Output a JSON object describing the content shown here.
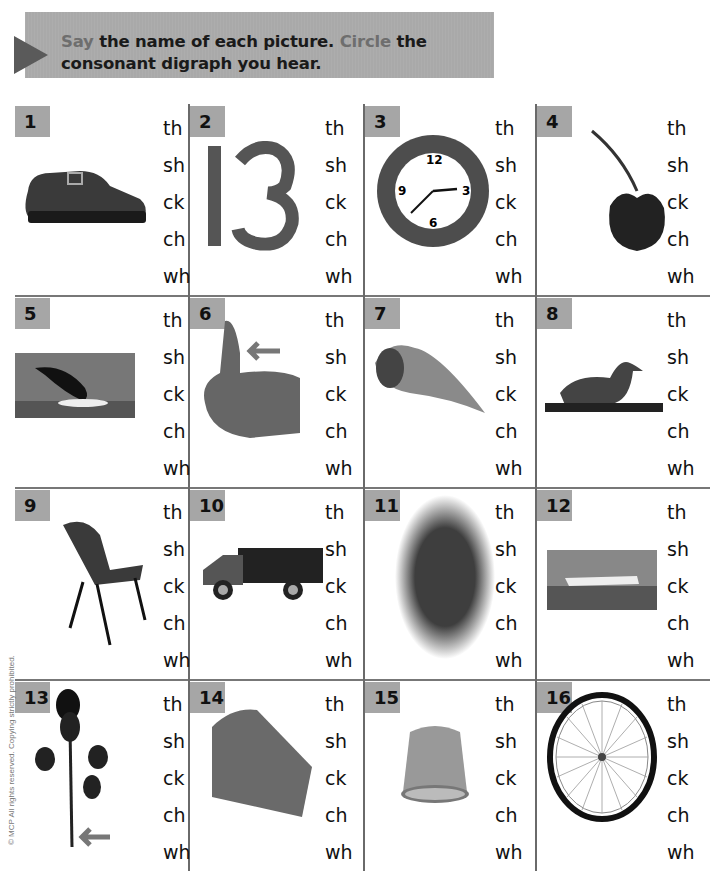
{
  "instruction": {
    "word_say": "Say",
    "part1": " the name of each picture. ",
    "word_circle": "Circle",
    "part2": " the consonant digraph you hear."
  },
  "choices": [
    "th",
    "sh",
    "ck",
    "ch",
    "wh"
  ],
  "items": [
    {
      "number": "1",
      "picture": "shoe-icon"
    },
    {
      "number": "2",
      "picture": "thirteen-icon"
    },
    {
      "number": "3",
      "picture": "clock-icon"
    },
    {
      "number": "4",
      "picture": "cherry-icon"
    },
    {
      "number": "5",
      "picture": "whale-icon"
    },
    {
      "number": "6",
      "picture": "thumb-icon"
    },
    {
      "number": "7",
      "picture": "shell-icon"
    },
    {
      "number": "8",
      "picture": "duck-icon"
    },
    {
      "number": "9",
      "picture": "chair-icon"
    },
    {
      "number": "10",
      "picture": "truck-icon"
    },
    {
      "number": "11",
      "picture": "wheat-icon"
    },
    {
      "number": "12",
      "picture": "ship-icon"
    },
    {
      "number": "13",
      "picture": "thorn-icon"
    },
    {
      "number": "14",
      "picture": "cheese-icon"
    },
    {
      "number": "15",
      "picture": "thimble-icon"
    },
    {
      "number": "16",
      "picture": "wheel-icon"
    }
  ],
  "footer": {
    "copyright": "© MCP All rights reserved. Copying strictly prohibited."
  },
  "colors": {
    "badge": "#a6a6a6",
    "banner": "#a9a9a9",
    "highlight": "#6e6e6e",
    "grid": "#6a6a6a"
  }
}
